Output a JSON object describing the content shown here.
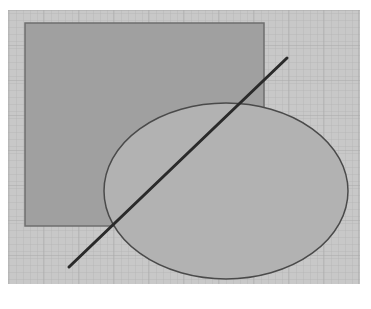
{
  "diagram": {
    "canvas": {
      "width": 371,
      "height": 309,
      "background": "#ffffff"
    },
    "grid_panel": {
      "x": 8,
      "y": 10,
      "width": 352,
      "height": 274,
      "fill": "#c8c8c8",
      "minor_line_color": "#b4b4b4",
      "major_line_color": "#a8a8a8",
      "minor_spacing": 7,
      "major_spacing": 35
    },
    "shapes": [
      {
        "type": "rectangle",
        "name": "rectangle",
        "x": 25,
        "y": 23,
        "width": 239,
        "height": 203,
        "fill": "#a0a0a0",
        "stroke": "#6e6e6e",
        "stroke_width": 1.5
      },
      {
        "type": "ellipse",
        "name": "ellipse",
        "cx": 226,
        "cy": 191,
        "rx": 122,
        "ry": 88,
        "fill": "#b2b2b2",
        "stroke": "#4a4a4a",
        "stroke_width": 1.5
      },
      {
        "type": "line",
        "name": "diagonal-line",
        "x1": 69,
        "y1": 267,
        "x2": 287,
        "y2": 58,
        "stroke": "#2a2a2a",
        "stroke_width": 3
      }
    ]
  }
}
